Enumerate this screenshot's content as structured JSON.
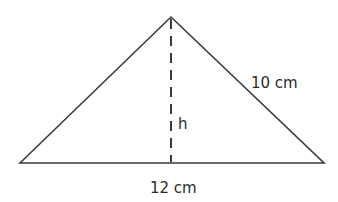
{
  "figure": {
    "shape": "isosceles triangle",
    "base_label": "12 cm",
    "side_label": "10 cm",
    "height_label": "h",
    "line_color": "#3a3a3a",
    "text_color": "#2b2b2b"
  }
}
